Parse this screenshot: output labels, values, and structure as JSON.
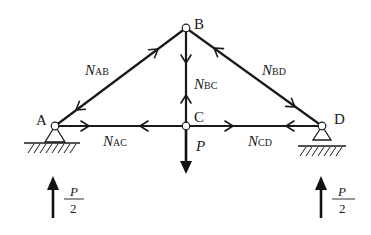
{
  "diagram": {
    "type": "truss-free-body",
    "nodes": [
      {
        "id": "A",
        "label": "A",
        "x": 55,
        "y": 126,
        "support": "pin"
      },
      {
        "id": "B",
        "label": "B",
        "x": 186,
        "y": 28
      },
      {
        "id": "C",
        "label": "C",
        "x": 186,
        "y": 126
      },
      {
        "id": "D",
        "label": "D",
        "x": 322,
        "y": 126,
        "support": "roller"
      }
    ],
    "members": [
      {
        "id": "AB",
        "from": "A",
        "to": "B",
        "label_main": "N",
        "label_sub": "AB",
        "state": "tension"
      },
      {
        "id": "BC",
        "from": "B",
        "to": "C",
        "label_main": "N",
        "label_sub": "BC",
        "state": "tension"
      },
      {
        "id": "BD",
        "from": "B",
        "to": "D",
        "label_main": "N",
        "label_sub": "BD",
        "state": "tension"
      },
      {
        "id": "AC",
        "from": "A",
        "to": "C",
        "label_main": "N",
        "label_sub": "AC",
        "state": "tension"
      },
      {
        "id": "CD",
        "from": "C",
        "to": "D",
        "label_main": "N",
        "label_sub": "CD",
        "state": "tension"
      }
    ],
    "loads": [
      {
        "id": "P",
        "at": "C",
        "label": "P",
        "direction": "down"
      }
    ],
    "reactions": [
      {
        "id": "RA",
        "at": "A",
        "numerator": "P",
        "denominator": "2",
        "direction": "up"
      },
      {
        "id": "RD",
        "at": "D",
        "numerator": "P",
        "denominator": "2",
        "direction": "up"
      }
    ]
  }
}
